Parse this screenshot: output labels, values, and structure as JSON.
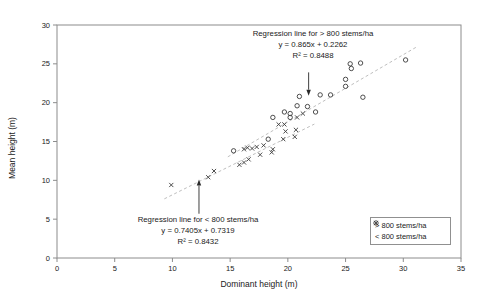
{
  "chart_data": {
    "type": "scatter",
    "xlabel": "Dominant height (m)",
    "ylabel": "Mean height (m)",
    "xlim": [
      0,
      35
    ],
    "ylim": [
      0,
      30
    ],
    "x_ticks": [
      0,
      5,
      10,
      15,
      20,
      25,
      30,
      35
    ],
    "y_ticks": [
      0,
      5,
      10,
      15,
      20,
      25,
      30
    ],
    "grid": false,
    "legend_position": "inside-bottom-right",
    "series": [
      {
        "name": "> 800 stems/ha",
        "marker": "circle",
        "points": [
          [
            15.3,
            13.8
          ],
          [
            18.3,
            15.3
          ],
          [
            18.7,
            18.1
          ],
          [
            19.7,
            18.8
          ],
          [
            20.2,
            18.6
          ],
          [
            20.2,
            18.1
          ],
          [
            20.8,
            19.6
          ],
          [
            21.7,
            19.5
          ],
          [
            22.4,
            18.8
          ],
          [
            21.0,
            20.8
          ],
          [
            22.8,
            21.0
          ],
          [
            23.7,
            21.0
          ],
          [
            26.5,
            20.7
          ],
          [
            25.0,
            22.1
          ],
          [
            25.0,
            23.0
          ],
          [
            25.4,
            25.0
          ],
          [
            25.5,
            24.4
          ],
          [
            26.3,
            25.1
          ],
          [
            30.2,
            25.5
          ]
        ]
      },
      {
        "name": "< 800 stems/ha",
        "marker": "x",
        "points": [
          [
            9.9,
            9.4
          ],
          [
            13.1,
            10.4
          ],
          [
            13.6,
            11.2
          ],
          [
            15.8,
            12.0
          ],
          [
            16.2,
            12.3
          ],
          [
            16.6,
            12.7
          ],
          [
            17.6,
            13.3
          ],
          [
            18.6,
            13.6
          ],
          [
            16.2,
            14.0
          ],
          [
            16.5,
            14.2
          ],
          [
            16.9,
            14.1
          ],
          [
            17.3,
            14.3
          ],
          [
            17.9,
            14.5
          ],
          [
            18.7,
            14.0
          ],
          [
            19.2,
            17.2
          ],
          [
            19.7,
            17.2
          ],
          [
            19.8,
            16.3
          ],
          [
            20.7,
            16.5
          ],
          [
            19.6,
            15.3
          ],
          [
            20.6,
            15.6
          ],
          [
            20.8,
            18.1
          ],
          [
            21.3,
            18.6
          ]
        ]
      }
    ],
    "regression_lines": [
      {
        "for": "> 800 stems/ha",
        "slope": 0.865,
        "intercept": 0.2262,
        "x_range": [
          14.8,
          31.2
        ]
      },
      {
        "for": "< 800 stems/ha",
        "slope": 0.7405,
        "intercept": 0.7319,
        "x_range": [
          9.3,
          22.3
        ]
      }
    ],
    "annotations": [
      {
        "lines": [
          "Regression line for > 800 stems/ha",
          "y = 0.865x + 0.2262",
          "R² = 0.8488"
        ],
        "arrow": {
          "from": [
            21.8,
            23.9
          ],
          "to": [
            21.8,
            20.9
          ]
        }
      },
      {
        "lines": [
          "Regression line for < 800 stems/ha",
          "y = 0.7405x + 0.7319",
          "R² = 0.8432"
        ],
        "arrow": {
          "from": [
            12.3,
            5.7
          ],
          "to": [
            12.3,
            10.1
          ]
        }
      }
    ]
  },
  "colors": {
    "frame": "#8c8c8c",
    "tick_text": "#1a1a1a",
    "marker": "#3a3a3a",
    "regression": "#bfbfbf",
    "arrow": "#2a2a2a",
    "background": "#ffffff"
  }
}
